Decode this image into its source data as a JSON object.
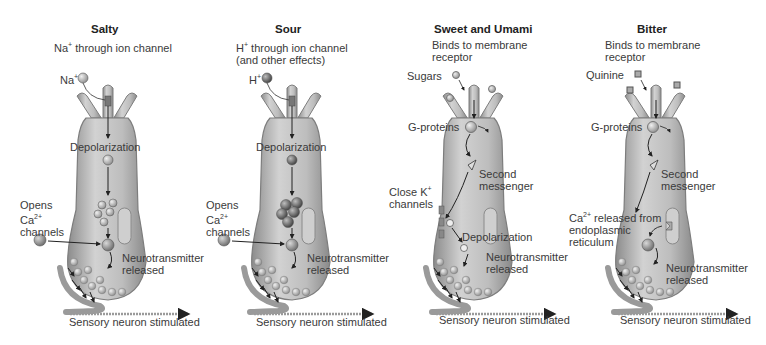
{
  "figure": {
    "panels": [
      {
        "id": "salty",
        "title": "Salty",
        "mechanism": "Na+ through ion channel",
        "stimulus_label": "Na+",
        "stimulus_shape": "sphere-plus",
        "labels": {
          "depolarization": "Depolarization",
          "side": "Opens\nCa2+\nchannels",
          "release": "Neurotransmitter\nreleased",
          "output": "Sensory neuron stimulated"
        }
      },
      {
        "id": "sour",
        "title": "Sour",
        "mechanism": "H+ through ion channel\n(and other effects)",
        "stimulus_label": "H+",
        "stimulus_shape": "sphere-dark",
        "labels": {
          "depolarization": "Depolarization",
          "side": "Opens\nCa2+\nchannels",
          "release": "Neurotransmitter\nreleased",
          "output": "Sensory neuron stimulated"
        }
      },
      {
        "id": "sweet-umami",
        "title": "Sweet and Umami",
        "mechanism": "Binds to membrane\nreceptor",
        "stimulus_label": "Sugars",
        "stimulus_shape": "sphere-light",
        "labels": {
          "g_proteins": "G-proteins",
          "second_messenger": "Second\nmessenger",
          "side": "Close K+\nchannels",
          "depolarization": "Depolarization",
          "release": "Neurotransmitter\nreleased",
          "output": "Sensory neuron stimulated"
        }
      },
      {
        "id": "bitter",
        "title": "Bitter",
        "mechanism": "Binds to membrane\nreceptor",
        "stimulus_label": "Quinine",
        "stimulus_shape": "cube",
        "labels": {
          "g_proteins": "G-proteins",
          "second_messenger": "Second\nmessenger",
          "side": "Ca2+ released from\nendoplasmic\nreticulum",
          "release": "Neurotransmitter\nreleased",
          "output": "Sensory neuron stimulated"
        }
      }
    ],
    "colors": {
      "cell_fill": "#b8b8b8",
      "cell_edge": "#7d7d7d",
      "cell_highlight": "#dcdcdc",
      "neuron": "#9a9a9a",
      "arrow": "#222222",
      "text": "#3a3a3a"
    }
  }
}
